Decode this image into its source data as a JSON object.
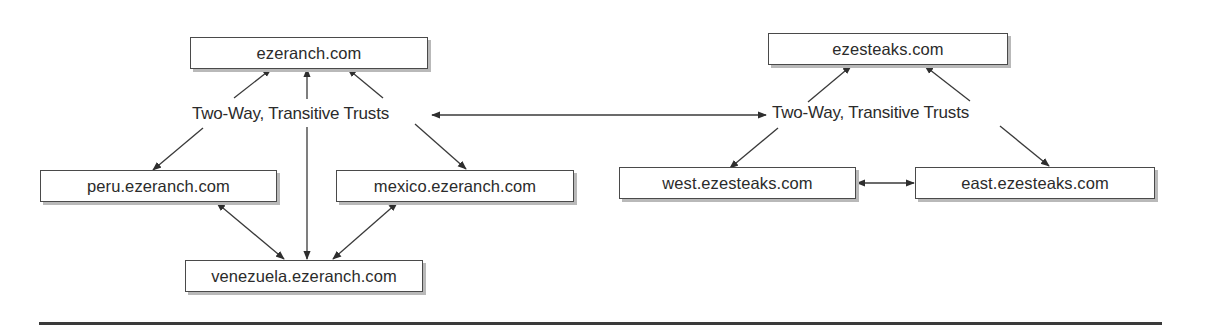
{
  "diagram": {
    "type": "domain-trust-tree",
    "forests": [
      {
        "root": {
          "id": "ezeranch",
          "label": "ezeranch.com"
        },
        "trust_label": "Two-Way, Transitive Trusts",
        "children": [
          {
            "id": "peru",
            "label": "peru.ezeranch.com"
          },
          {
            "id": "mexico",
            "label": "mexico.ezeranch.com"
          },
          {
            "id": "venezuela",
            "label": "venezuela.ezeranch.com"
          }
        ]
      },
      {
        "root": {
          "id": "ezesteaks",
          "label": "ezesteaks.com"
        },
        "trust_label": "Two-Way, Transitive Trusts",
        "children": [
          {
            "id": "west",
            "label": "west.ezesteaks.com"
          },
          {
            "id": "east",
            "label": "east.ezesteaks.com"
          }
        ]
      }
    ],
    "edges": [
      {
        "from": "trust_label_left",
        "to": "ezeranch",
        "direction": "to"
      },
      {
        "from": "trust_label_left",
        "to": "peru",
        "direction": "to"
      },
      {
        "from": "trust_label_left",
        "to": "mexico",
        "direction": "to"
      },
      {
        "from": "ezeranch",
        "to": "venezuela",
        "direction": "both"
      },
      {
        "from": "peru",
        "to": "venezuela",
        "direction": "both"
      },
      {
        "from": "mexico",
        "to": "venezuela",
        "direction": "both"
      },
      {
        "from": "trust_label_left",
        "to": "trust_label_right",
        "direction": "both"
      },
      {
        "from": "trust_label_right",
        "to": "ezesteaks",
        "direction": "to"
      },
      {
        "from": "trust_label_right",
        "to": "west",
        "direction": "to"
      },
      {
        "from": "trust_label_right",
        "to": "east",
        "direction": "to"
      },
      {
        "from": "west",
        "to": "east",
        "direction": "both"
      }
    ],
    "colors": {
      "stroke": "#3a3a3a",
      "box_border": "#4a4a4a",
      "shadow": "#b9b9b9",
      "text": "#2b2b2b",
      "background": "#ffffff"
    }
  }
}
